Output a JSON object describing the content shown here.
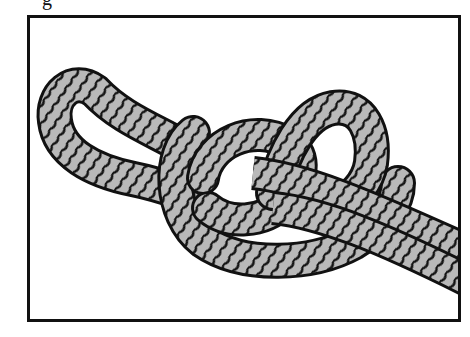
{
  "figure": {
    "caption_fragment": "g",
    "colors": {
      "rope_fill": "#b9b9b9",
      "rope_outline": "#111111",
      "frame_border": "#111111",
      "background": "#ffffff"
    },
    "parts": {
      "left_loop": "closed eye loop",
      "knot_body": "central coiled knot",
      "standing_ends": "two parallel strands exiting right"
    }
  }
}
